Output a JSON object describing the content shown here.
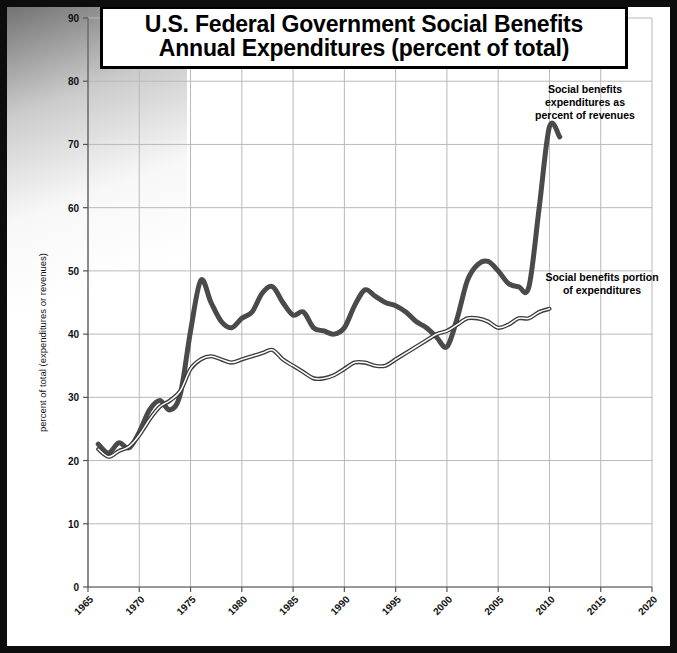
{
  "title": {
    "line1": "U.S. Federal Government Social Benefits",
    "line2": "Annual Expenditures (percent of total)"
  },
  "annotations": {
    "revenues": {
      "line1": "Social benefits",
      "line2": "expenditures as",
      "line3": "percent of revenues"
    },
    "expenditures": {
      "line1": "Social benefits portion",
      "line2": "of expenditures"
    }
  },
  "colors": {
    "series_dark": "#4a4a4a",
    "series_thin": "#3d3d3d",
    "grid": "#b9b9b9",
    "axis": "#555555",
    "frame": "#0d0d0d",
    "background": "#ffffff"
  },
  "chart_data": {
    "type": "line",
    "title": "U.S. Federal Government Social Benefits Annual Expenditures (percent of total)",
    "xlabel": "",
    "ylabel": "percent of total (expenditures or revenues)",
    "xlim": [
      1965,
      2020
    ],
    "ylim": [
      0,
      90
    ],
    "xticks": [
      1965,
      1970,
      1975,
      1980,
      1985,
      1990,
      1995,
      2000,
      2005,
      2010,
      2015,
      2020
    ],
    "yticks": [
      0,
      10,
      20,
      30,
      40,
      50,
      60,
      70,
      80,
      90
    ],
    "grid": true,
    "legend_position": "annotations-inline",
    "series": [
      {
        "name": "Social benefits expenditures as percent of revenues",
        "style": "thick",
        "x": [
          1966,
          1967,
          1968,
          1969,
          1970,
          1971,
          1972,
          1973,
          1974,
          1975,
          1976,
          1977,
          1978,
          1979,
          1980,
          1981,
          1982,
          1983,
          1984,
          1985,
          1986,
          1987,
          1988,
          1989,
          1990,
          1991,
          1992,
          1993,
          1994,
          1995,
          1996,
          1997,
          1998,
          1999,
          2000,
          2001,
          2002,
          2003,
          2004,
          2005,
          2006,
          2007,
          2008,
          2009,
          2010,
          2011
        ],
        "values": [
          22.6,
          21.2,
          22.8,
          22.0,
          24.5,
          28.0,
          29.5,
          28.0,
          30.5,
          40.5,
          48.5,
          45.0,
          42.0,
          41.0,
          42.5,
          43.5,
          46.5,
          47.5,
          45.0,
          43.0,
          43.5,
          41.0,
          40.5,
          40.0,
          41.0,
          44.5,
          47.0,
          46.0,
          45.0,
          44.5,
          43.5,
          42.0,
          41.0,
          39.5,
          38.0,
          42.5,
          48.5,
          51.0,
          51.5,
          50.0,
          48.0,
          47.5,
          47.5,
          60.0,
          72.8,
          71.2
        ]
      },
      {
        "name": "Social benefits portion of expenditures",
        "style": "thin-double",
        "x": [
          1966,
          1967,
          1968,
          1969,
          1970,
          1971,
          1972,
          1973,
          1974,
          1975,
          1976,
          1977,
          1978,
          1979,
          1980,
          1981,
          1982,
          1983,
          1984,
          1985,
          1986,
          1987,
          1988,
          1989,
          1990,
          1991,
          1992,
          1993,
          1994,
          1995,
          1996,
          1997,
          1998,
          1999,
          2000,
          2001,
          2002,
          2003,
          2004,
          2005,
          2006,
          2007,
          2008,
          2009,
          2010
        ],
        "values": [
          21.8,
          20.6,
          21.5,
          22.2,
          24.0,
          26.5,
          28.5,
          29.5,
          31.0,
          34.5,
          36.0,
          36.5,
          36.0,
          35.5,
          36.0,
          36.5,
          37.0,
          37.5,
          36.0,
          35.0,
          34.0,
          33.0,
          33.0,
          33.5,
          34.5,
          35.5,
          35.5,
          35.0,
          35.0,
          36.0,
          37.0,
          38.0,
          39.0,
          40.0,
          40.5,
          41.5,
          42.5,
          42.5,
          42.0,
          41.0,
          41.5,
          42.5,
          42.5,
          43.5,
          44.0
        ]
      }
    ]
  },
  "axis": {
    "y_label_text": "percent of total (expenditures or revenues)"
  }
}
